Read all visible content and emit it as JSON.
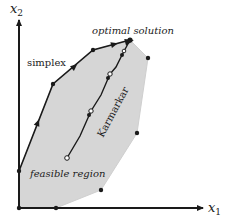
{
  "diagram": {
    "axes": {
      "x_label": "x",
      "x_sub": "1",
      "y_label": "x",
      "y_sub": "2"
    },
    "labels": {
      "simplex": "simplex",
      "optimal": "optimal solution",
      "karmarkar": "Karmarkar",
      "feasible": "feasible region"
    },
    "colors": {
      "region_fill": "#d6d6d6",
      "line": "#1a1a1a",
      "background": "#ffffff"
    },
    "feasible_region_vertices": [
      [
        19,
        208
      ],
      [
        19,
        171
      ],
      [
        53,
        84
      ],
      [
        93,
        50
      ],
      [
        130,
        40
      ],
      [
        148,
        58
      ],
      [
        137,
        133
      ],
      [
        101,
        190
      ],
      [
        56,
        208
      ]
    ],
    "simplex_path": [
      [
        19,
        171
      ],
      [
        53,
        84
      ],
      [
        93,
        50
      ],
      [
        130,
        40
      ]
    ],
    "karmarkar_path": [
      [
        67,
        158
      ],
      [
        80,
        136
      ],
      [
        91,
        111
      ],
      [
        101,
        95
      ],
      [
        110,
        74
      ],
      [
        116,
        67
      ],
      [
        122,
        55
      ],
      [
        130,
        40
      ]
    ]
  }
}
